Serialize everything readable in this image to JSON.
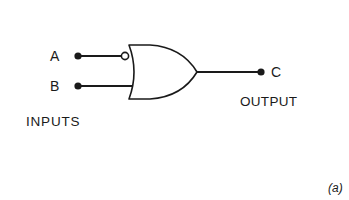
{
  "diagram": {
    "type": "logic-gate",
    "gate": "OR gate with inverted input A",
    "inputs": [
      {
        "label": "A",
        "inverted": true
      },
      {
        "label": "B",
        "inverted": false
      }
    ],
    "output": {
      "label": "C"
    },
    "inputs_group_label": "INPUTS",
    "output_group_label": "OUTPUT",
    "caption": "(a)"
  },
  "colors": {
    "stroke": "#1a1a1a",
    "background": "#ffffff"
  }
}
